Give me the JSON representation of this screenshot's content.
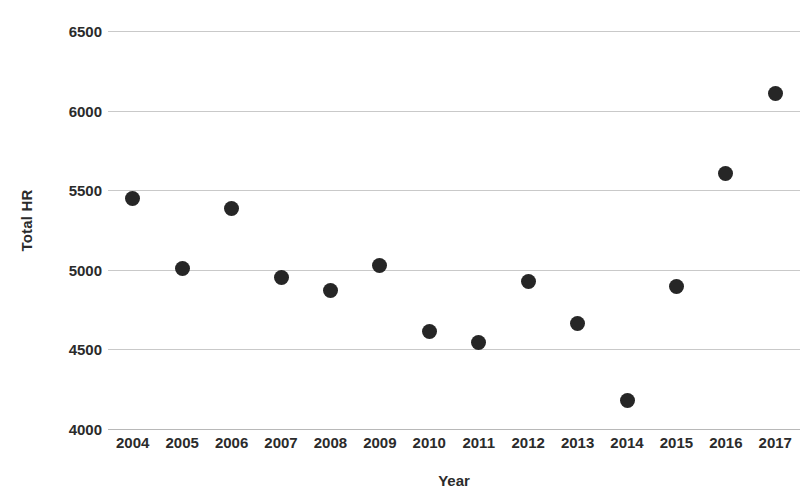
{
  "chart_data": {
    "type": "scatter",
    "title": "",
    "title_clipped": true,
    "xlabel": "Year",
    "ylabel": "Total HR",
    "categories": [
      2004,
      2005,
      2006,
      2007,
      2008,
      2009,
      2010,
      2011,
      2012,
      2013,
      2014,
      2015,
      2016,
      2017
    ],
    "x_tick_labels": [
      "2004",
      "2005",
      "2006",
      "2007",
      "2008",
      "2009",
      "2010",
      "2011",
      "2012",
      "2013",
      "2014",
      "2015",
      "2016",
      "2017"
    ],
    "values": [
      5450,
      5010,
      5386,
      4950,
      4870,
      5030,
      4610,
      4545,
      4925,
      4660,
      4180,
      4895,
      5605,
      6105
    ],
    "series": [
      {
        "name": "Total HR",
        "points": [
          {
            "x": 2004,
            "y": 5450
          },
          {
            "x": 2005,
            "y": 5010
          },
          {
            "x": 2006,
            "y": 5386
          },
          {
            "x": 2007,
            "y": 4950
          },
          {
            "x": 2008,
            "y": 4870
          },
          {
            "x": 2009,
            "y": 5030
          },
          {
            "x": 2010,
            "y": 4610
          },
          {
            "x": 2011,
            "y": 4545
          },
          {
            "x": 2012,
            "y": 4925
          },
          {
            "x": 2013,
            "y": 4660
          },
          {
            "x": 2014,
            "y": 4180
          },
          {
            "x": 2015,
            "y": 4895
          },
          {
            "x": 2016,
            "y": 5605
          },
          {
            "x": 2017,
            "y": 6105
          }
        ]
      }
    ],
    "ylim": [
      4000,
      6500
    ],
    "y_tick_values": [
      4000,
      4500,
      5000,
      5500,
      6000,
      6500
    ],
    "y_tick_labels": [
      "4000",
      "4500",
      "5000",
      "5500",
      "6000",
      "6500"
    ],
    "grid": true,
    "grid_axis": "y",
    "legend": false,
    "legend_position": "none",
    "marker_color": "#262626",
    "gridline_color": "#c9c9c9",
    "background_color": "#ffffff"
  }
}
